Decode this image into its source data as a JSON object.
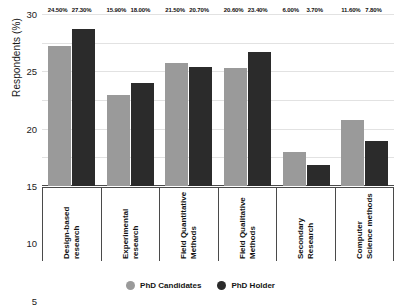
{
  "chart_data": {
    "type": "bar",
    "title": "",
    "xlabel": "",
    "ylabel": "Respondents (%)",
    "ylim": [
      0,
      30
    ],
    "ytick_step": 5,
    "yticks": [
      "30",
      "25",
      "20",
      "15",
      "10",
      "5",
      "0"
    ],
    "grid": true,
    "legend_position": "bottom",
    "categories": [
      "Design-based research",
      "Experimental research",
      "Field Quantitative Methods",
      "Field Qualitative Methods",
      "Secondary Research",
      "Computer Science methods"
    ],
    "series": [
      {
        "name": "PhD Candidates",
        "color": "#9a9a9a",
        "values": [
          24.5,
          15.9,
          21.5,
          20.6,
          6.0,
          11.6
        ],
        "labels": [
          "24.50%",
          "15.90%",
          "21.50%",
          "20.60%",
          "6.00%",
          "11.60%"
        ]
      },
      {
        "name": "PhD Holder",
        "color": "#2b2b2b",
        "values": [
          27.3,
          18.0,
          20.7,
          23.4,
          3.7,
          7.8
        ],
        "labels": [
          "27.30%",
          "18.00%",
          "20.70%",
          "23.40%",
          "3.70%",
          "7.80%"
        ]
      }
    ]
  }
}
